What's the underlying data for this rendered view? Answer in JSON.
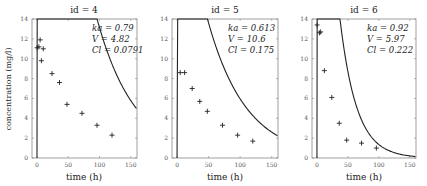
{
  "chart_data": [
    {
      "type": "line",
      "title": "id = 4",
      "xlabel": "time (h)",
      "ylabel": "concentration (mg/l)",
      "xlim": [
        -8,
        160
      ],
      "ylim": [
        0,
        14
      ],
      "xticks": [
        0,
        50,
        100,
        150
      ],
      "yticks": [
        0,
        2,
        4,
        6,
        8,
        10,
        12,
        14
      ],
      "params": [
        "ka = 0.79",
        "V  = 4.82",
        "Cl = 0.0791"
      ],
      "model": {
        "ka": 0.79,
        "V": 4.82,
        "Cl": 0.0791,
        "dose": 320
      },
      "observations": [
        {
          "x": 0.25,
          "y": 11.1
        },
        {
          "x": 3,
          "y": 11.2
        },
        {
          "x": 5,
          "y": 11.9
        },
        {
          "x": 7,
          "y": 9.8
        },
        {
          "x": 10,
          "y": 11.0
        },
        {
          "x": 24,
          "y": 8.5
        },
        {
          "x": 36,
          "y": 7.6
        },
        {
          "x": 48,
          "y": 5.4
        },
        {
          "x": 72,
          "y": 4.5
        },
        {
          "x": 96,
          "y": 3.3
        },
        {
          "x": 120,
          "y": 2.3
        }
      ]
    },
    {
      "type": "line",
      "title": "id = 5",
      "xlabel": "time (h)",
      "ylabel": "",
      "xlim": [
        -8,
        160
      ],
      "ylim": [
        0,
        14
      ],
      "xticks": [
        0,
        50,
        100,
        150
      ],
      "yticks": [
        0,
        2,
        4,
        6,
        8,
        10,
        12,
        14
      ],
      "params": [
        "ka = 0.613",
        "V  = 10.6",
        "Cl = 0.175"
      ],
      "model": {
        "ka": 0.613,
        "V": 10.6,
        "Cl": 0.175,
        "dose": 320
      },
      "observations": [
        {
          "x": 5,
          "y": 8.6
        },
        {
          "x": 12,
          "y": 8.6
        },
        {
          "x": 24,
          "y": 7.0
        },
        {
          "x": 36,
          "y": 5.7
        },
        {
          "x": 48,
          "y": 4.7
        },
        {
          "x": 72,
          "y": 3.3
        },
        {
          "x": 96,
          "y": 2.3
        },
        {
          "x": 120,
          "y": 1.7
        }
      ]
    },
    {
      "type": "line",
      "title": "id = 6",
      "xlabel": "time (h)",
      "ylabel": "",
      "xlim": [
        -8,
        160
      ],
      "ylim": [
        0,
        14
      ],
      "xticks": [
        0,
        50,
        100,
        150
      ],
      "yticks": [
        0,
        2,
        4,
        6,
        8,
        10,
        12,
        14
      ],
      "params": [
        "ka = 0.92",
        "V  = 5.97",
        "Cl = 0.222"
      ],
      "model": {
        "ka": 0.92,
        "V": 5.97,
        "Cl": 0.222,
        "dose": 320
      },
      "observations": [
        {
          "x": 0.25,
          "y": 13.4
        },
        {
          "x": 4,
          "y": 12.6
        },
        {
          "x": 6,
          "y": 12.7
        },
        {
          "x": 12,
          "y": 8.8
        },
        {
          "x": 24,
          "y": 6.1
        },
        {
          "x": 36,
          "y": 3.5
        },
        {
          "x": 48,
          "y": 1.8
        },
        {
          "x": 72,
          "y": 1.5
        },
        {
          "x": 96,
          "y": 1.0
        }
      ]
    }
  ]
}
